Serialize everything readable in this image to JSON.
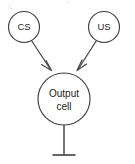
{
  "diagram": {
    "background_color": "#ffffff",
    "stroke_color": "#4a4a4a",
    "text_color": "#1d1d1d",
    "nodes": [
      {
        "id": "cs",
        "label": "CS",
        "shape": "circle",
        "cx": 24,
        "cy": 27,
        "r": 15.5
      },
      {
        "id": "us",
        "label": "US",
        "shape": "circle",
        "cx": 104,
        "cy": 27,
        "r": 15.5
      },
      {
        "id": "output-cell",
        "label_line1": "Output",
        "label_line2": "cell",
        "shape": "circle",
        "cx": 64,
        "cy": 99,
        "r": 26
      }
    ],
    "connections": [
      {
        "id": "cs-to-output",
        "from": "cs",
        "to": "output-cell",
        "ending": "arrow"
      },
      {
        "id": "us-to-output",
        "from": "us",
        "to": "output-cell",
        "ending": "arrow"
      },
      {
        "id": "output-axon",
        "from": "output-cell",
        "to": "terminal",
        "ending": "bar"
      }
    ]
  }
}
